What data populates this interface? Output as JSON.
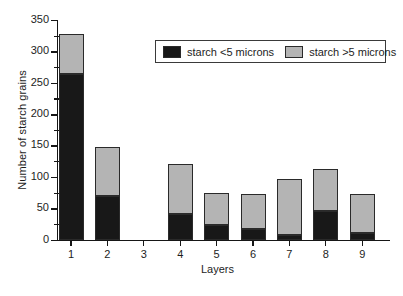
{
  "chart_data": {
    "type": "bar",
    "subtype": "stacked-bar",
    "title": "",
    "xlabel": "Layers",
    "ylabel": "Number of starch grains",
    "categories": [
      "1",
      "2",
      "3",
      "4",
      "5",
      "6",
      "7",
      "8",
      "9"
    ],
    "series": [
      {
        "name": "starch <5 microns",
        "color": "#181818",
        "values": [
          264,
          70,
          0,
          41,
          24,
          17,
          8,
          45,
          11
        ]
      },
      {
        "name": "starch >5 microns",
        "color": "#b4b4b4",
        "values": [
          64,
          77,
          0,
          80,
          51,
          56,
          88,
          67,
          61
        ]
      }
    ],
    "totals": [
      328,
      147,
      0,
      121,
      75,
      73,
      96,
      112,
      72
    ],
    "ylim": [
      0,
      350
    ],
    "ytick_major": [
      0,
      50,
      100,
      150,
      200,
      250,
      300,
      350
    ],
    "ytick_minor": [
      25,
      75,
      125,
      175,
      225,
      275,
      325
    ],
    "ytick_labels": [
      "0",
      "50",
      "100",
      "150",
      "200",
      "250",
      "300",
      "350"
    ],
    "grid": false,
    "legend_position": "upper center",
    "legend_entries": [
      "starch <5 microns",
      "starch >5 microns"
    ]
  },
  "axes": {
    "ylabel": "Number of starch grains",
    "xlabel": "Layers"
  },
  "legend": {
    "items": [
      {
        "label": "starch <5 microns",
        "swatch": "black-square-icon"
      },
      {
        "label": "starch >5 microns",
        "swatch": "gray-square-icon"
      }
    ]
  }
}
